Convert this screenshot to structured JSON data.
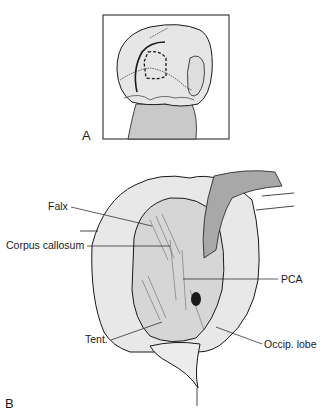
{
  "figure": {
    "panels": [
      {
        "id": "A",
        "letter": "A",
        "description": "Posterior view of head showing skin incision and craniotomy outline (dashed)"
      },
      {
        "id": "B",
        "letter": "B",
        "description": "Operative view of occipital interhemispheric approach"
      }
    ],
    "labels": {
      "falx": "Falx",
      "corpus_callosum": "Corpus callosum",
      "pca": "PCA",
      "tent": "Tent.",
      "occip_lobe": "Occip. lobe"
    },
    "colors": {
      "line": "#1a1a1a",
      "neck_fill": "#c9c9c9",
      "head_fill": "#e6e6e6",
      "retractor_fill": "#a8a8a8",
      "tissue_fill": "#d8d8d8"
    }
  }
}
